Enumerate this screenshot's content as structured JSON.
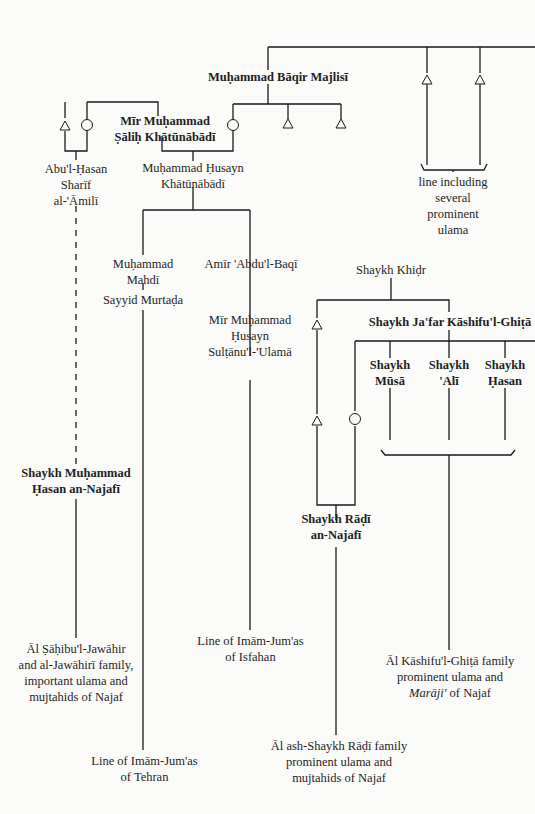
{
  "diagram": {
    "type": "genealogy",
    "nodes": {
      "majlisi": {
        "lines": [
          "Muḥammad Bāqir Majlisī"
        ],
        "bold": true
      },
      "mir_salih": {
        "lines": [
          "Mīr Muḥammad",
          "Ṣāliḥ Khātūnābādī"
        ],
        "bold": true
      },
      "abul_hasan": {
        "lines": [
          "Abu'l-Ḥasan",
          "Sharīf",
          "al-'Āmilī"
        ],
        "bold": false
      },
      "muhammad_husayn": {
        "lines": [
          "Muḥammad Ḥusayn",
          "Khātūnābādī"
        ],
        "bold": false
      },
      "line_ulama": {
        "lines": [
          "line including",
          "several",
          "prominent",
          "ulama"
        ],
        "bold": false
      },
      "muhammad_mahdi": {
        "lines": [
          "Muḥammad",
          "Mahdī"
        ],
        "bold": false
      },
      "amir_abdul_baqi": {
        "lines": [
          "Amīr 'Abdu'l-Baqī"
        ],
        "bold": false
      },
      "sayyid_murtada": {
        "lines": [
          "Sayyid Murtaḍa"
        ],
        "bold": false
      },
      "mir_sultanul": {
        "lines": [
          "Mīr Muḥammad",
          "Ḥusayn",
          "Sulṭānu'l-'Ulamā"
        ],
        "bold": false
      },
      "shaykh_khidr": {
        "lines": [
          "Shaykh Khiḍr"
        ],
        "bold": false
      },
      "jafar": {
        "lines": [
          "Shaykh Ja'far Kāshifu'l-Ghiṭā"
        ],
        "bold": true
      },
      "musa": {
        "lines": [
          "Shaykh",
          "Mūsā"
        ],
        "bold": true
      },
      "ali": {
        "lines": [
          "Shaykh",
          "'Alī"
        ],
        "bold": true
      },
      "hasan": {
        "lines": [
          "Shaykh",
          "Ḥasan"
        ],
        "bold": true
      },
      "muhammad_hasan_najafi": {
        "lines": [
          "Shaykh Muḥammad",
          "Ḥasan an-Najafī"
        ],
        "bold": true
      },
      "radi_najafi": {
        "lines": [
          "Shaykh Rāḍī",
          "an-Najafī"
        ],
        "bold": true
      },
      "jawahiri_family": {
        "lines": [
          "Āl Ṣāḥibu'l-Jawāhir",
          "and al-Jawāhirī family,",
          "important ulama and",
          "mujtahids of Najaf"
        ],
        "bold": false
      },
      "isfahan_line": {
        "lines": [
          "Line of Imām-Jum'as",
          "of Isfahan"
        ],
        "bold": false
      },
      "kashif_family": {
        "lines": [
          "Āl Kāshifu'l-Ghiṭā family",
          "prominent ulama and",
          "Marāji' of Najaf"
        ],
        "bold": false,
        "italic_word": "Marāji'"
      },
      "tehran_line": {
        "lines": [
          "Line of Imām-Jum'as",
          "of Tehran"
        ],
        "bold": false
      },
      "radi_family": {
        "lines": [
          "Āl ash-Shaykh Rāḍī family",
          "prominent ulama and",
          "mujtahids of Najaf"
        ],
        "bold": false
      }
    },
    "legend_symbols": {
      "male": "triangle",
      "female": "circle"
    }
  }
}
